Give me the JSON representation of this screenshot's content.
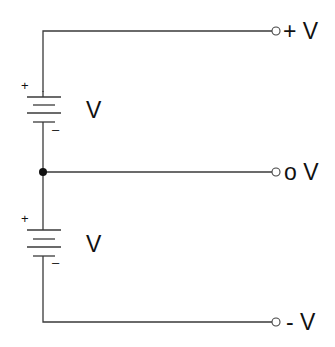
{
  "diagram": {
    "type": "split-supply-battery-schematic",
    "colors": {
      "wire": "#3a3a3a",
      "junction": "#111111",
      "text": "#111111",
      "background": "#ffffff"
    },
    "batteries": [
      {
        "label": "V",
        "plus_sign": "+",
        "minus_sign": "–"
      },
      {
        "label": "V",
        "plus_sign": "+",
        "minus_sign": "–"
      }
    ],
    "terminals": [
      {
        "label": "+ V"
      },
      {
        "label": "o V"
      },
      {
        "label": "- V"
      }
    ]
  }
}
